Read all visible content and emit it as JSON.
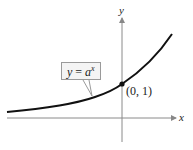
{
  "diagram": {
    "function_label": {
      "lhs": "y",
      "eq": " = ",
      "base": "a",
      "exponent": "x"
    },
    "point_label": "(0, 1)",
    "axis_labels": {
      "x": "x",
      "y": "y"
    },
    "colors": {
      "curve": "#111111",
      "axis": "#888888",
      "box_border": "#9a9a9a",
      "box_fill": "#f4f4f4"
    }
  }
}
